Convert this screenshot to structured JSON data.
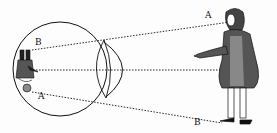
{
  "figure": {
    "labels": {
      "top_outer": "A",
      "bottom_outer": "B",
      "top_inner": "B",
      "bottom_inner": "A"
    },
    "colors": {
      "ink": "#111111",
      "paper": "#fdfdfd"
    }
  }
}
